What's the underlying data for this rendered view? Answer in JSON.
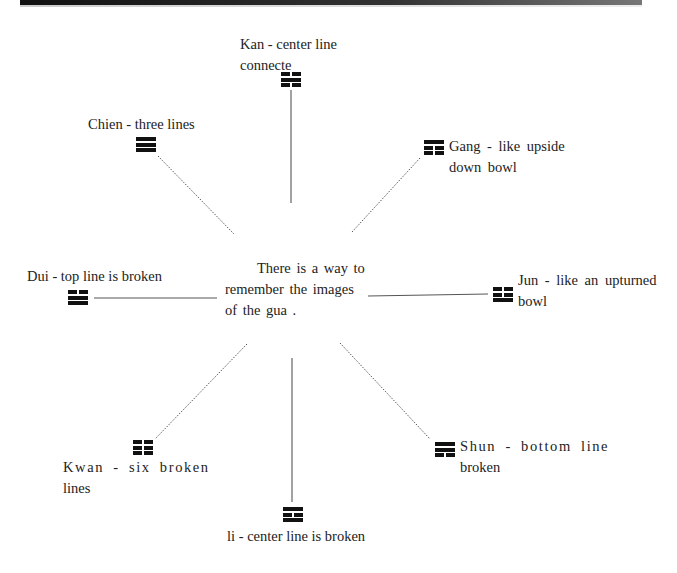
{
  "diagram": {
    "center_text": [
      "There is a way to",
      "remember the images",
      "of the gua ."
    ],
    "trigrams": [
      {
        "id": "kan",
        "name": "Kan",
        "label_lines": [
          "Kan - center line",
          "connecte"
        ],
        "pattern": [
          "broken",
          "solid",
          "broken"
        ]
      },
      {
        "id": "chien",
        "name": "Chien",
        "label_lines": [
          "Chien - three lines"
        ],
        "pattern": [
          "solid",
          "solid",
          "solid"
        ]
      },
      {
        "id": "gang",
        "name": "Gang",
        "label_lines": [
          "Gang - like upside",
          "down bowl"
        ],
        "pattern": [
          "solid",
          "broken",
          "broken"
        ]
      },
      {
        "id": "dui",
        "name": "Dui",
        "label_lines": [
          "Dui - top line is broken"
        ],
        "pattern": [
          "broken",
          "solid",
          "solid"
        ]
      },
      {
        "id": "jun",
        "name": "Jun",
        "label_lines": [
          "Jun - like an upturned",
          "bowl"
        ],
        "pattern": [
          "broken",
          "broken",
          "solid"
        ]
      },
      {
        "id": "kwan",
        "name": "Kwan",
        "label_lines": [
          "Kwan - six broken",
          "lines"
        ],
        "pattern": [
          "broken",
          "broken",
          "broken"
        ]
      },
      {
        "id": "shun",
        "name": "Shun",
        "label_lines": [
          "Shun - bottom line",
          "broken"
        ],
        "pattern": [
          "solid",
          "solid",
          "broken"
        ]
      },
      {
        "id": "li",
        "name": "li",
        "label_lines": [
          "li - center line is broken"
        ],
        "pattern": [
          "solid",
          "broken",
          "solid"
        ]
      }
    ],
    "connectors": [
      {
        "to": "kan",
        "style": "solid"
      },
      {
        "to": "chien",
        "style": "dotted"
      },
      {
        "to": "gang",
        "style": "dotted"
      },
      {
        "to": "dui",
        "style": "solid"
      },
      {
        "to": "jun",
        "style": "solid"
      },
      {
        "to": "kwan",
        "style": "dotted"
      },
      {
        "to": "shun",
        "style": "dotted"
      },
      {
        "to": "li",
        "style": "solid"
      }
    ]
  }
}
